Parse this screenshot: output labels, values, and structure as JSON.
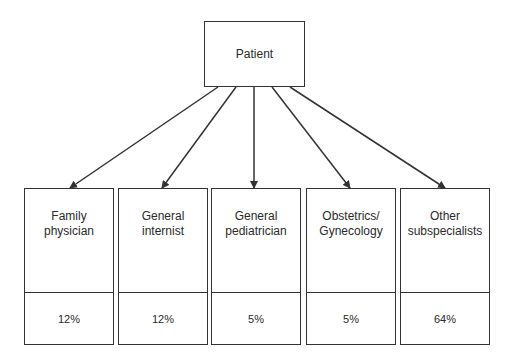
{
  "diagram": {
    "root": {
      "label": "Patient"
    },
    "categories": [
      {
        "label": "Family\nphysician",
        "percent": "12%"
      },
      {
        "label": "General\ninternist",
        "percent": "12%"
      },
      {
        "label": "General\npediatrician",
        "percent": "5%"
      },
      {
        "label": "Obstetrics/\nGynecology",
        "percent": "5%"
      },
      {
        "label": "Other\nsubspecialists",
        "percent": "64%"
      }
    ],
    "colors": {
      "line": "#333333",
      "text": "#2a2a2a",
      "background": "#ffffff"
    }
  }
}
